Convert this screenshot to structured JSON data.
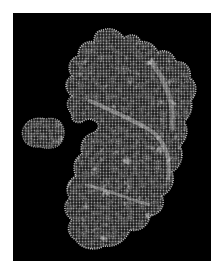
{
  "figure": {
    "background": "#000000",
    "border": "#ffffff",
    "surface_color": "#d8d8d8",
    "mesh_color": "#f2f2f2"
  },
  "objects": [
    {
      "name": "small-molecule",
      "position": "left",
      "approx_bbox": [
        23,
        118,
        63,
        148
      ]
    },
    {
      "name": "main-protein-surface",
      "position": "center-right",
      "approx_bbox": [
        62,
        25,
        197,
        250
      ],
      "feature": "concave binding pocket on left side facing small molecule"
    }
  ]
}
